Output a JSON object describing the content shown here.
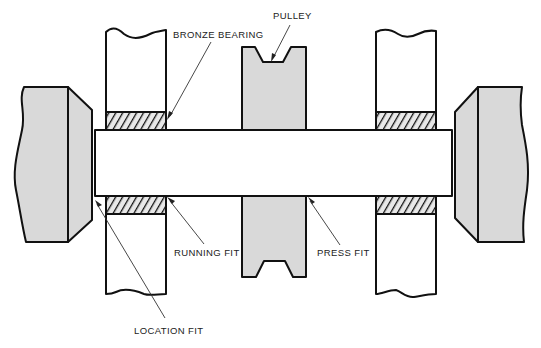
{
  "diagram": {
    "labels": {
      "bronze_bearing": "BRONZE BEARING",
      "pulley": "PULLEY",
      "running_fit": "RUNNING FIT",
      "press_fit": "PRESS FIT",
      "location_fit": "LOCATION FIT"
    },
    "components": [
      {
        "name": "left-chuck",
        "type": "support block",
        "fill": "#d9d9d9"
      },
      {
        "name": "left-bearing-housing",
        "type": "housing with bronze bearing",
        "fill": "#ffffff"
      },
      {
        "name": "pulley",
        "type": "V-groove pulley",
        "fill": "#d9d9d9"
      },
      {
        "name": "right-bearing-housing",
        "type": "housing with bronze bearing",
        "fill": "#ffffff"
      },
      {
        "name": "right-chuck",
        "type": "support block",
        "fill": "#d9d9d9"
      },
      {
        "name": "shaft",
        "type": "shaft",
        "fill": "#ffffff"
      }
    ],
    "colors": {
      "part_fill": "#d9d9d9",
      "outline": "#111111",
      "background": "#ffffff"
    }
  }
}
